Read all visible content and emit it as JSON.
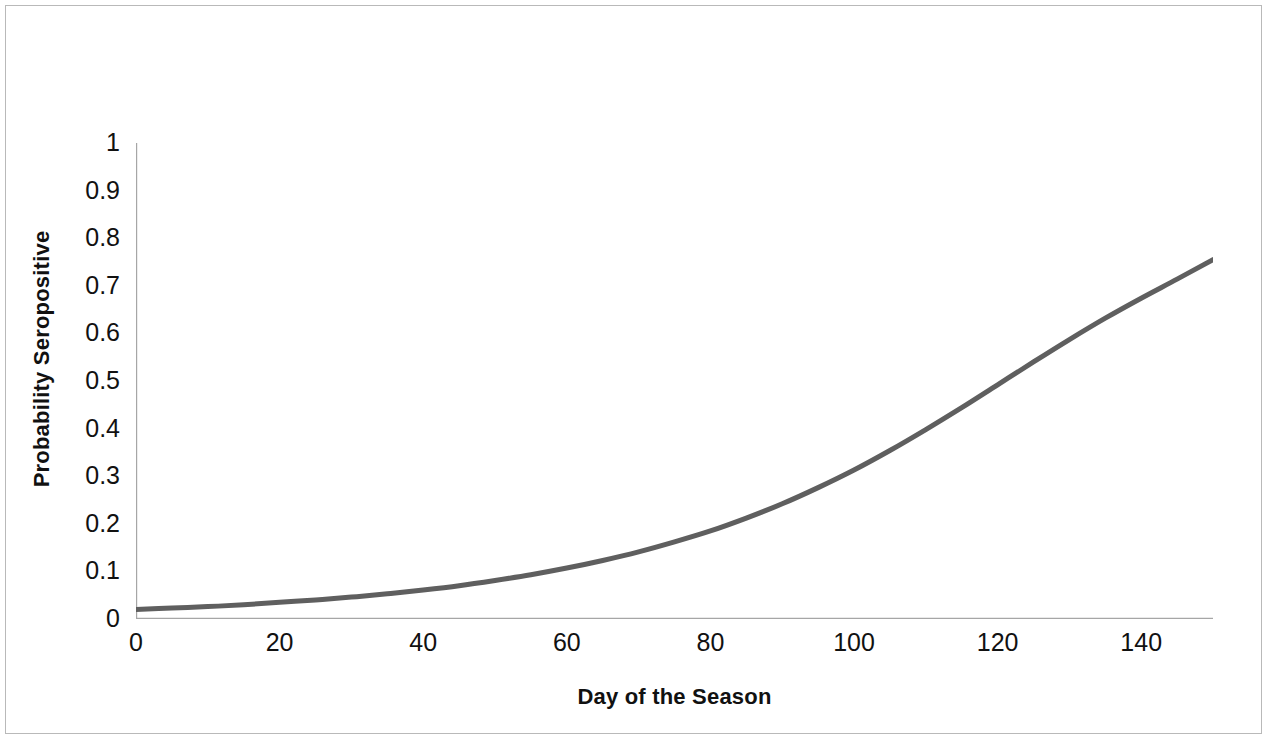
{
  "chart_data": {
    "type": "line",
    "title": "",
    "subtitle": "",
    "xlabel": "Day of the Season",
    "ylabel": "Probability Seropositive",
    "xlim": [
      0,
      150
    ],
    "ylim": [
      0,
      1
    ],
    "xticks": [
      0,
      20,
      40,
      60,
      80,
      100,
      120,
      140
    ],
    "xtick_labels": [
      "0",
      "20",
      "40",
      "60",
      "80",
      "100",
      "120",
      "140"
    ],
    "yticks": [
      0,
      0.1,
      0.2,
      0.3,
      0.4,
      0.5,
      0.6,
      0.7,
      0.8,
      0.9,
      1
    ],
    "ytick_labels": [
      "0",
      "0.1",
      "0.2",
      "0.3",
      "0.4",
      "0.5",
      "0.6",
      "0.7",
      "0.8",
      "0.9",
      "1"
    ],
    "y_minor_tick_step": 0.05,
    "x_minor_tick_step": 20,
    "grid": false,
    "legend": null,
    "legend_position": "none",
    "series": [
      {
        "name": "Probability Seropositive",
        "color": "#5f5f5f",
        "line_width": 5,
        "x": [
          0,
          5,
          10,
          15,
          20,
          25,
          30,
          35,
          40,
          45,
          50,
          55,
          60,
          65,
          70,
          75,
          80,
          85,
          90,
          95,
          100,
          105,
          110,
          115,
          120,
          125,
          130,
          135,
          140,
          145,
          150
        ],
        "values": [
          0.02,
          0.023,
          0.026,
          0.03,
          0.035,
          0.04,
          0.046,
          0.053,
          0.061,
          0.07,
          0.081,
          0.093,
          0.107,
          0.123,
          0.141,
          0.162,
          0.185,
          0.212,
          0.242,
          0.276,
          0.313,
          0.354,
          0.398,
          0.444,
          0.492,
          0.54,
          0.587,
          0.632,
          0.674,
          0.714,
          0.755
        ]
      }
    ]
  },
  "axis": {
    "axis_color": "#a6a6a6",
    "tick_color": "#a6a6a6",
    "text_color": "#111111",
    "frame_color": "#b9b9b9",
    "background": "#ffffff"
  }
}
